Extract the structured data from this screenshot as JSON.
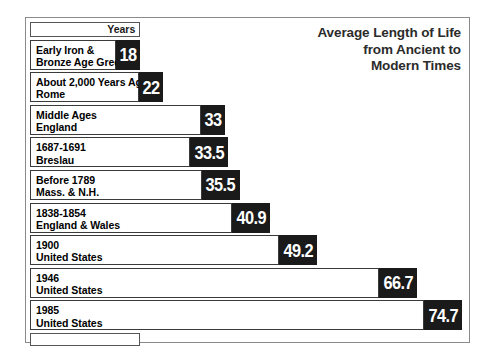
{
  "chart_data": {
    "type": "bar",
    "title": "Average Length of Life from Ancient to Modern Times",
    "title_lines": [
      "Average Length of Life",
      "from Ancient to",
      "Modern Times"
    ],
    "axis_header": "Years",
    "xlabel": "Years",
    "ylabel": "",
    "orientation": "horizontal",
    "grid": false,
    "legend": false,
    "xlim": [
      0,
      78
    ],
    "categories": [
      "Early Iron & Bronze Age Greece",
      "About 2,000 Years Ago Rome",
      "Middle Ages England",
      "1687-1691 Breslau",
      "Before 1789 Mass. & N.H.",
      "1838-1854 England & Wales",
      "1900 United States",
      "1946 United States",
      "1985 United States"
    ],
    "values": [
      18,
      22,
      33,
      33.5,
      35.5,
      40.9,
      49.2,
      66.7,
      74.7
    ],
    "bars": [
      {
        "line1": "Early Iron &",
        "line2": "Bronze Age Greece",
        "value": 18,
        "value_label": "18"
      },
      {
        "line1": "About 2,000 Years Ago",
        "line2": "Rome",
        "value": 22,
        "value_label": "22"
      },
      {
        "line1": "Middle Ages",
        "line2": "England",
        "value": 33,
        "value_label": "33"
      },
      {
        "line1": "1687-1691",
        "line2": "Breslau",
        "value": 33.5,
        "value_label": "33.5"
      },
      {
        "line1": "Before 1789",
        "line2": "Mass. & N.H.",
        "value": 35.5,
        "value_label": "35.5"
      },
      {
        "line1": "1838-1854",
        "line2": "England & Wales",
        "value": 40.9,
        "value_label": "40.9"
      },
      {
        "line1": "1900",
        "line2": "United States",
        "value": 49.2,
        "value_label": "49.2"
      },
      {
        "line1": "1946",
        "line2": "United States",
        "value": 66.7,
        "value_label": "66.7"
      },
      {
        "line1": "1985",
        "line2": "United States",
        "value": 74.7,
        "value_label": "74.7"
      }
    ]
  },
  "colors": {
    "value_box_fill": "#1a1a1a",
    "value_box_text": "#ffffff",
    "bar_border": "#3a3a3a",
    "frame_border": "#8a8a8a",
    "background": "#ffffff",
    "label_text": "#000000",
    "title_text": "#2b2b2b"
  }
}
